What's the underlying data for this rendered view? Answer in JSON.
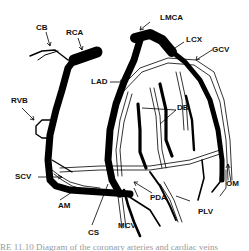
{
  "figure": {
    "labels": {
      "cb": "CB",
      "rca": "RCA",
      "lmca": "LMCA",
      "lcx": "LCX",
      "gcv": "GCV",
      "lad": "LAD",
      "db": "DB",
      "rvb": "RVB",
      "scv": "SCV",
      "am": "AM",
      "cs": "CS",
      "mcv": "MCV",
      "pda": "PDA",
      "plv": "PLV",
      "om": "OM"
    },
    "caption": "RE 11.10  Diagram of the coronary arteries and cardiac veins"
  }
}
